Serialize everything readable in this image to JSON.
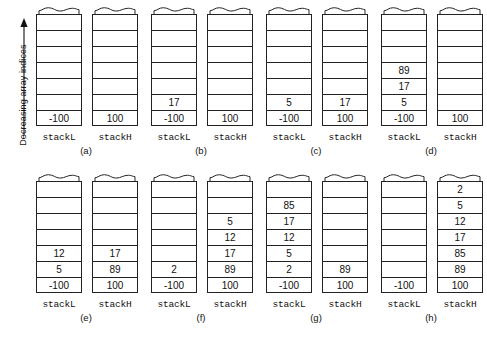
{
  "axis": {
    "label": "Decreasing array indices",
    "arrow_direction": "up"
  },
  "labels": {
    "stackL": "stackL",
    "stackH": "stackH",
    "spL": "spL",
    "spH": "spH"
  },
  "diagram": {
    "type": "two-stack-merge-trace",
    "column_capacity": 7,
    "panels": [
      {
        "caption": "(a)",
        "stackL": {
          "name": "stackL",
          "pointer": "spL",
          "values": [
            "-100"
          ],
          "pointer_side": "left"
        },
        "stackH": {
          "name": "stackH",
          "pointer": "spH",
          "values": [
            "100"
          ],
          "pointer_side": "left"
        }
      },
      {
        "caption": "(b)",
        "stackL": {
          "name": "stackL",
          "pointer": "spL",
          "values": [
            "17",
            "-100"
          ],
          "pointer_side": "left"
        },
        "stackH": {
          "name": "stackH",
          "pointer": "spH",
          "values": [
            "100"
          ],
          "pointer_side": "left"
        }
      },
      {
        "caption": "(c)",
        "stackL": {
          "name": "stackL",
          "pointer": "spL",
          "values": [
            "5",
            "-100"
          ],
          "pointer_side": "left"
        },
        "stackH": {
          "name": "stackH",
          "pointer": "spH",
          "values": [
            "17",
            "100"
          ],
          "pointer_side": "left"
        }
      },
      {
        "caption": "(d)",
        "stackL": {
          "name": "stackL",
          "pointer": "spL",
          "values": [
            "89",
            "17",
            "5",
            "-100"
          ],
          "pointer_side": "left"
        },
        "stackH": {
          "name": "stackH",
          "pointer": "spH",
          "values": [
            "100"
          ],
          "pointer_side": "left"
        }
      },
      {
        "caption": "(e)",
        "stackL": {
          "name": "stackL",
          "pointer": "spL",
          "values": [
            "12",
            "5",
            "-100"
          ],
          "pointer_side": "left"
        },
        "stackH": {
          "name": "stackH",
          "pointer": "spH",
          "values": [
            "17",
            "89",
            "100"
          ],
          "pointer_side": "left"
        }
      },
      {
        "caption": "(f)",
        "stackL": {
          "name": "stackL",
          "pointer": "spL",
          "values": [
            "2",
            "-100"
          ],
          "pointer_side": "left"
        },
        "stackH": {
          "name": "stackH",
          "pointer": "spH",
          "values": [
            "5",
            "12",
            "17",
            "89",
            "100"
          ],
          "pointer_side": "left"
        }
      },
      {
        "caption": "(g)",
        "stackL": {
          "name": "stackL",
          "pointer": "spL",
          "values": [
            "85",
            "17",
            "12",
            "5",
            "2",
            "-100"
          ],
          "pointer_side": "left"
        },
        "stackH": {
          "name": "stackH",
          "pointer": "spH",
          "values": [
            "89",
            "100"
          ],
          "pointer_side": "left"
        }
      },
      {
        "caption": "(h)",
        "stackL": {
          "name": "stackL",
          "pointer": "spL",
          "values": [
            "-100"
          ],
          "pointer_side": "left"
        },
        "stackH": {
          "name": "stackH",
          "pointer": "spH",
          "values": [
            "2",
            "5",
            "12",
            "17",
            "85",
            "89",
            "100"
          ],
          "pointer_side": "left"
        }
      }
    ]
  },
  "colors": {
    "background": "#ffffff",
    "stroke": "#222222",
    "text": "#111111"
  }
}
